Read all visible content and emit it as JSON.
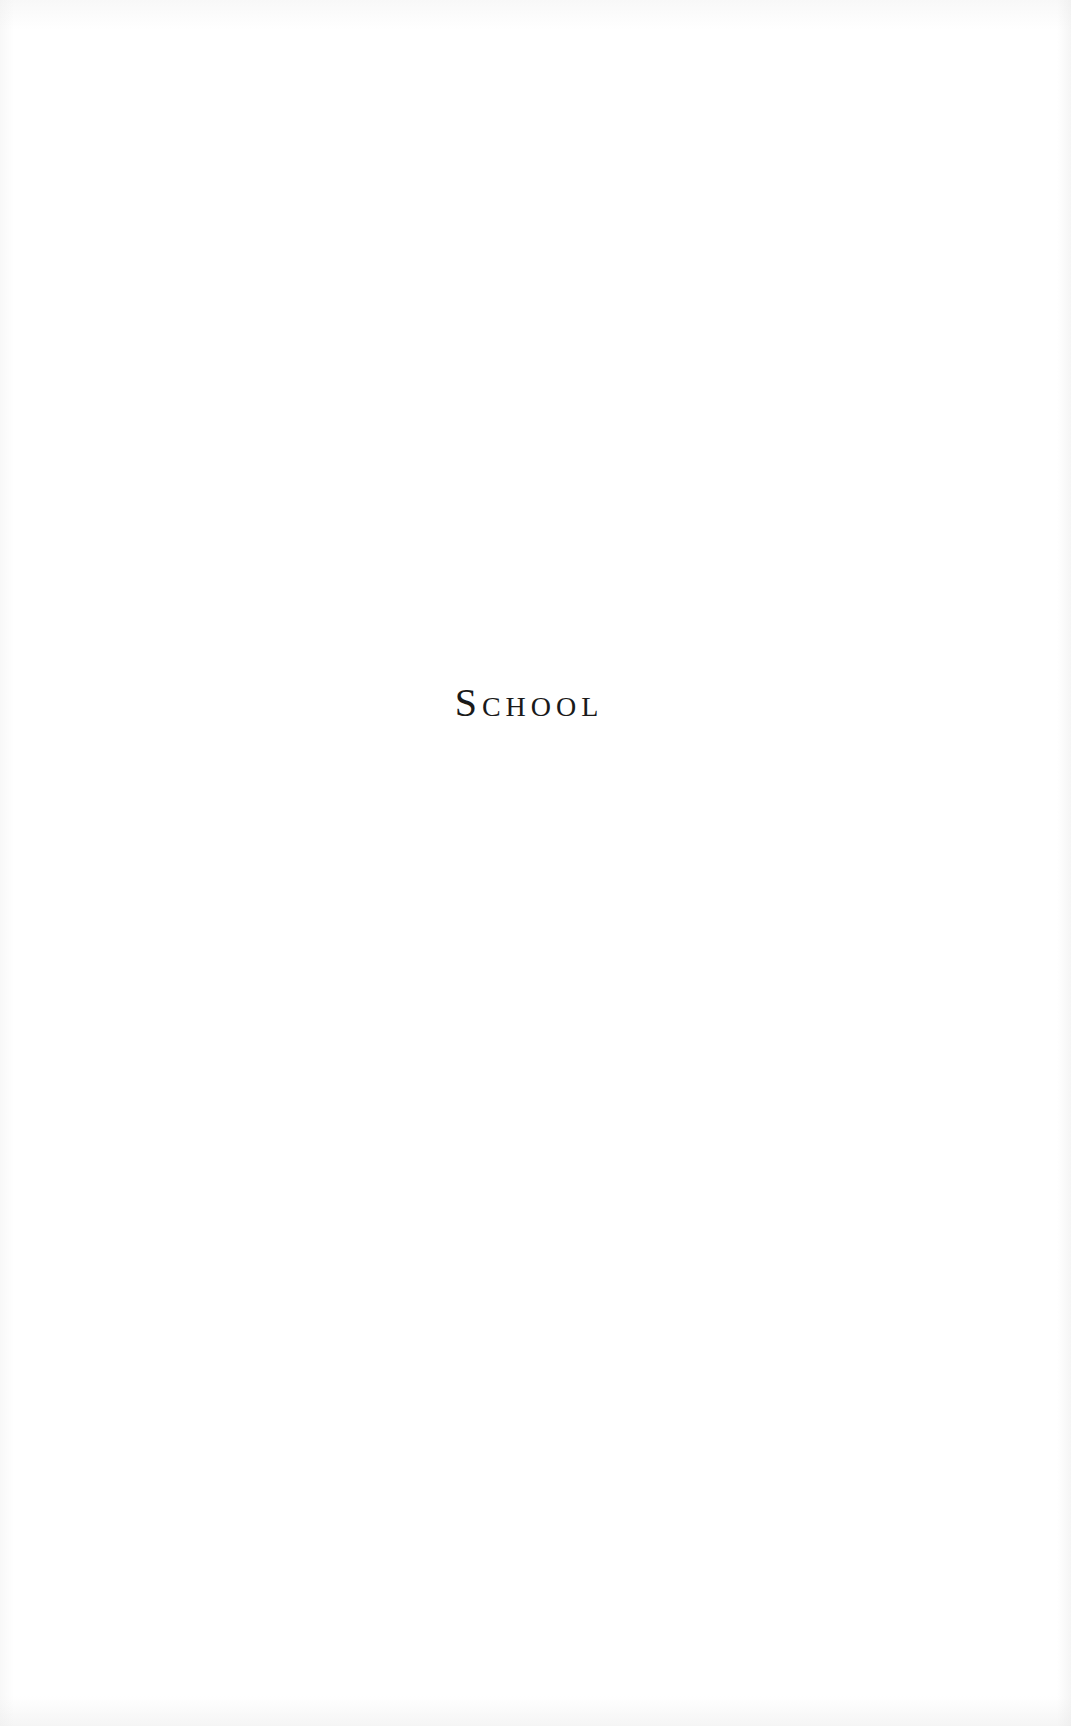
{
  "page": {
    "section_title": "School",
    "background_color": "#ffffff",
    "text_color": "#1a1a1a"
  }
}
